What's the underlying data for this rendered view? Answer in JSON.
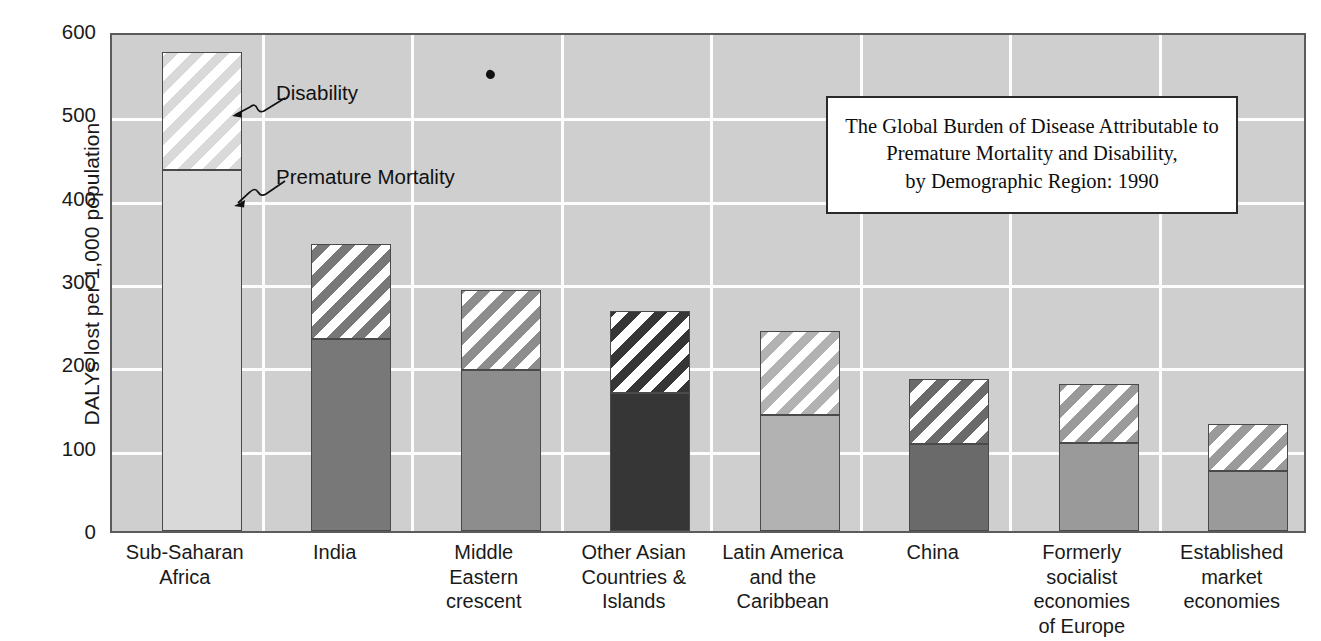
{
  "chart_data": {
    "type": "bar",
    "title": "The Global Burden of Disease Attributable to Premature Mortality and Disability, by Demographic Region: 1990",
    "title_lines": [
      "The Global Burden of Disease Attributable to",
      "Premature Mortality and Disability,",
      "by Demographic Region: 1990"
    ],
    "xlabel": "",
    "ylabel": "DALYs lost per 1,000 population",
    "ylim": [
      0,
      600
    ],
    "ytick_labels": [
      "600",
      "500",
      "400",
      "300",
      "200",
      "100",
      "0"
    ],
    "ytick_values": [
      600,
      500,
      400,
      300,
      200,
      100,
      0
    ],
    "grid": true,
    "legend_position": "annotated-callouts",
    "stacked": true,
    "categories": [
      "Sub-Saharan Africa",
      "India",
      "Middle Eastern crescent",
      "Other Asian Countries & Islands",
      "Latin America and the Caribbean",
      "China",
      "Formerly socialist economies of Europe",
      "Established market economies"
    ],
    "category_label_lines": [
      [
        "Sub-Saharan",
        "Africa"
      ],
      [
        "India"
      ],
      [
        "Middle",
        "Eastern",
        "crescent"
      ],
      [
        "Other Asian",
        "Countries &",
        "Islands"
      ],
      [
        "Latin America",
        "and the",
        "Caribbean"
      ],
      [
        "China"
      ],
      [
        "Formerly",
        "socialist",
        "economies",
        "of Europe"
      ],
      [
        "Established",
        "market",
        "economies"
      ]
    ],
    "series": [
      {
        "name": "Premature Mortality",
        "values": [
          433,
          231,
          193,
          166,
          139,
          105,
          106,
          72
        ]
      },
      {
        "name": "Disability",
        "values": [
          142,
          113,
          96,
          98,
          101,
          78,
          70,
          56
        ]
      }
    ],
    "totals": [
      575,
      344,
      289,
      264,
      240,
      183,
      176,
      128
    ],
    "bar_colors": [
      "#d9d9d9",
      "#787878",
      "#8d8d8d",
      "#363636",
      "#b2b2b2",
      "#6a6a6a",
      "#9a9a9a",
      "#9a9a9a"
    ],
    "annotations": [
      {
        "name": "Disability",
        "label": "Disability"
      },
      {
        "name": "Premature Mortality",
        "label": "Premature Mortality"
      }
    ],
    "style": {
      "plot_background": "#cfcfcf",
      "gridline_color": "#fdfdfd",
      "axis_color": "#5b5b5b",
      "bar_outline": "#4a4a4a",
      "hatch_color": "#ffffff",
      "text_color": "#1a1a1a",
      "title_box_background": "#ffffff",
      "title_box_border": "#2a2a2a"
    }
  }
}
